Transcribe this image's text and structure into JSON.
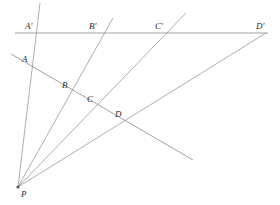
{
  "figure": {
    "background_color": "#ffffff",
    "line_color": "#8d8d8d",
    "label_color": "#2b2b2b",
    "width": 280,
    "height": 205
  },
  "labels": {
    "p": "P",
    "a": "A",
    "b": "B",
    "c": "C",
    "d": "D",
    "a_prime": "A'",
    "b_prime": "B'",
    "c_prime": "C'",
    "d_prime": "D'"
  },
  "label_positions": {
    "p": {
      "x": 21,
      "y": 190
    },
    "a": {
      "x": 22,
      "y": 55
    },
    "b": {
      "x": 62,
      "y": 81
    },
    "c": {
      "x": 87,
      "y": 95
    },
    "d": {
      "x": 115,
      "y": 110
    },
    "a_prime": {
      "x": 25,
      "y": 22
    },
    "b_prime": {
      "x": 89,
      "y": 22
    },
    "c_prime": {
      "x": 155,
      "y": 22
    },
    "d_prime": {
      "x": 256,
      "y": 22
    }
  },
  "points": {
    "P": {
      "x": 18,
      "y": 187
    },
    "A": {
      "x": 32,
      "y": 65
    },
    "B": {
      "x": 70,
      "y": 93
    },
    "C": {
      "x": 95,
      "y": 107
    },
    "D": {
      "x": 123,
      "y": 122
    },
    "A_prime": {
      "x": 38,
      "y": 33
    },
    "B_prime": {
      "x": 104,
      "y": 33
    },
    "C_prime": {
      "x": 167,
      "y": 33
    },
    "D_prime": {
      "x": 265,
      "y": 33
    }
  },
  "segments": {
    "transversal_lower": {
      "x1": 11,
      "y1": 54,
      "x2": 193,
      "y2": 160
    },
    "transversal_upper": {
      "x1": 15,
      "y1": 33,
      "x2": 268,
      "y2": 33
    },
    "ray_a": {
      "x1": 18,
      "y1": 187,
      "x2": 40,
      "y2": 3
    },
    "ray_b": {
      "x1": 18,
      "y1": 187,
      "x2": 113,
      "y2": 18
    },
    "ray_c": {
      "x1": 18,
      "y1": 187,
      "x2": 186,
      "y2": 13
    },
    "ray_d": {
      "x1": 18,
      "y1": 187,
      "x2": 266,
      "y2": 33
    }
  },
  "elements": {
    "vertex_name": "P",
    "ray_names": [
      "PA-A'",
      "PB-B'",
      "PC-C'",
      "PD-D'"
    ],
    "line_names": [
      "line-ABCD",
      "line-A'B'C'D'"
    ]
  }
}
